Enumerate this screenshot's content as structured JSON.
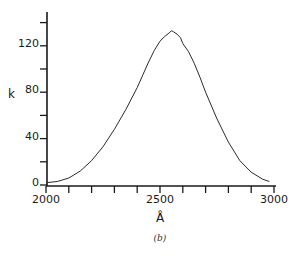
{
  "chart_data": {
    "type": "line",
    "title": "",
    "caption": "(b)",
    "xlabel": "Å",
    "ylabel": "k",
    "xlim": [
      2000,
      3000
    ],
    "ylim": [
      0,
      145
    ],
    "x_ticks": [
      2000,
      2100,
      2200,
      2300,
      2400,
      2500,
      2600,
      2700,
      2800,
      2900,
      3000
    ],
    "x_tick_labels": [
      {
        "value": 2000,
        "label": "2000"
      },
      {
        "value": 2500,
        "label": "2500"
      },
      {
        "value": 3000,
        "label": "3000"
      }
    ],
    "y_ticks": [
      0,
      20,
      40,
      60,
      80,
      100,
      120,
      140
    ],
    "y_tick_labels": [
      {
        "value": 0,
        "label": "0"
      },
      {
        "value": 40,
        "label": "40"
      },
      {
        "value": 80,
        "label": "80"
      },
      {
        "value": 120,
        "label": "120"
      }
    ],
    "grid": false,
    "legend": null,
    "series": [
      {
        "name": "k",
        "x": [
          2000,
          2050,
          2100,
          2150,
          2200,
          2250,
          2300,
          2350,
          2400,
          2425,
          2450,
          2475,
          2500,
          2520,
          2540,
          2550,
          2560,
          2575,
          2590,
          2600,
          2625,
          2650,
          2675,
          2700,
          2750,
          2800,
          2850,
          2900,
          2950,
          2980
        ],
        "y": [
          2,
          3,
          6,
          12,
          21,
          33,
          48,
          65,
          84,
          95,
          106,
          116,
          124,
          128,
          131,
          133,
          132,
          130,
          127,
          122,
          115,
          105,
          93,
          80,
          57,
          37,
          21,
          11,
          5,
          3
        ]
      }
    ]
  }
}
